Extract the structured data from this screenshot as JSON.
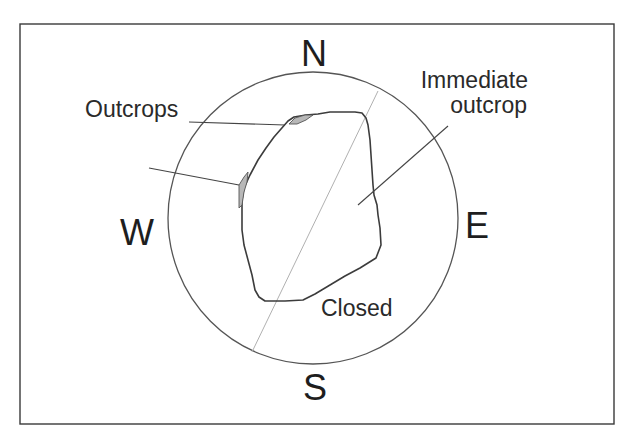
{
  "diagram": {
    "type": "horizon-view-sky-diagram",
    "cardinals": {
      "north": "N",
      "south": "S",
      "east": "E",
      "west": "W"
    },
    "labels": {
      "outcrops": "Outcrops",
      "immediate_line1": "Immediate",
      "immediate_line2": "outcrop",
      "closed": "Closed"
    },
    "colors": {
      "frame": "#3a3a3a",
      "horizon_circle": "#555555",
      "axis_line": "#b0b0b0",
      "outline": "#3c3c3c",
      "outcrop_fill": "#b8b8b8",
      "text": "#1e1e1e"
    }
  }
}
